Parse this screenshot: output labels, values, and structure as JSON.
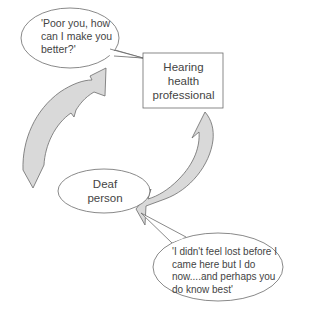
{
  "diagram": {
    "top_speech_bubble": {
      "text_line1": "'Poor you, how",
      "text_line2": "can I make you",
      "text_line3": "better?'"
    },
    "professional_box": {
      "line1": "Hearing",
      "line2": "health",
      "line3": "professional"
    },
    "deaf_person_ellipse": {
      "line1": "Deaf",
      "line2": "person"
    },
    "bottom_speech_bubble": {
      "text_line1": "'I didn't feel lost before I",
      "text_line2": "came here but I do",
      "text_line3": "now....and perhaps you",
      "text_line4": "do know best'"
    },
    "colors": {
      "arrow_fill": "#d9d9d9",
      "stroke": "#6b6b6b",
      "text": "#444444",
      "background": "#ffffff"
    }
  }
}
